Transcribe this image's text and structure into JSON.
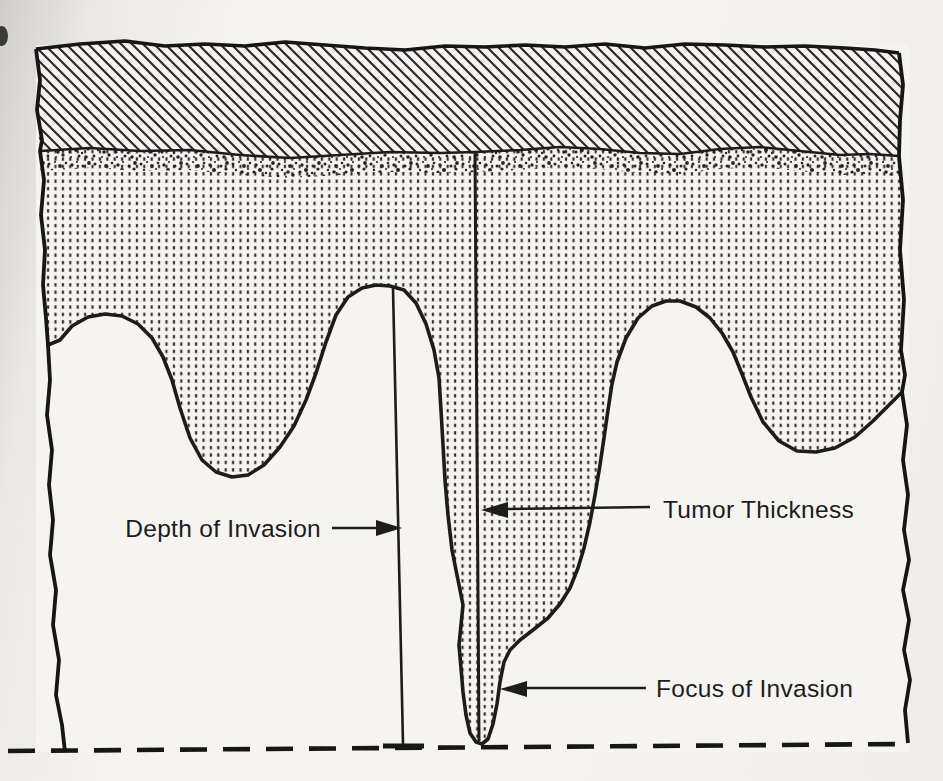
{
  "figure": {
    "labels": {
      "depth_of_invasion": "Depth of Invasion",
      "tumor_thickness": "Tumor Thickness",
      "focus_of_invasion": "Focus of Invasion"
    },
    "colors": {
      "ink": "#1c1c1c",
      "paper": "#f5f4f1",
      "margin_shadow": "#cfcecb"
    }
  }
}
